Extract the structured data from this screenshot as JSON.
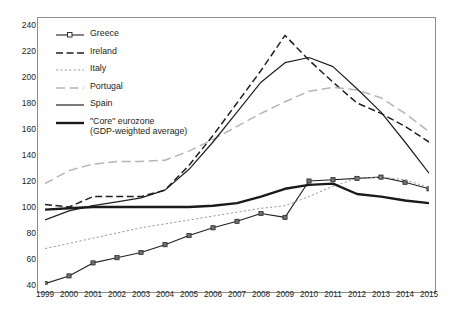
{
  "chart_data": {
    "type": "line",
    "title": "",
    "subtitle": "",
    "xlabel": "",
    "ylabel": "",
    "x": [
      1999,
      2000,
      2001,
      2002,
      2003,
      2004,
      2005,
      2006,
      2007,
      2008,
      2009,
      2010,
      2011,
      2012,
      2013,
      2014,
      2015
    ],
    "xticklabels": [
      "1999",
      "2000",
      "2001",
      "2002",
      "2003",
      "2004",
      "2005",
      "2006",
      "2007",
      "2008",
      "2009",
      "2010",
      "2011",
      "2012",
      "2013",
      "2014",
      "2015"
    ],
    "yticklabels": [
      "40",
      "60",
      "80",
      "100",
      "120",
      "140",
      "160",
      "180",
      "200",
      "220",
      "240"
    ],
    "yticks": [
      40,
      60,
      80,
      100,
      120,
      140,
      160,
      180,
      200,
      220,
      240
    ],
    "ylim": [
      40,
      240
    ],
    "grid": false,
    "legend_position": "upper-left",
    "series": [
      {
        "name": "Greece",
        "style": "solid-marker",
        "color": "#231f20",
        "marker": "square",
        "values": [
          41,
          47,
          57,
          61,
          65,
          71,
          78,
          84,
          89,
          95,
          92,
          120,
          121,
          122,
          123,
          119,
          114
        ]
      },
      {
        "name": "Ireland",
        "style": "dashed",
        "color": "#231f20",
        "marker": "none",
        "values": [
          102,
          100,
          108,
          108,
          108,
          113,
          132,
          155,
          180,
          205,
          232,
          213,
          196,
          180,
          172,
          162,
          150
        ]
      },
      {
        "name": "Italy",
        "style": "dotted",
        "color": "#9c9c9c",
        "marker": "none",
        "values": [
          68,
          72,
          76,
          80,
          84,
          87,
          90,
          93,
          96,
          99,
          101,
          108,
          116,
          122,
          123,
          121,
          115
        ]
      },
      {
        "name": "Portugal",
        "style": "long-dashed",
        "color": "#b5b5b5",
        "marker": "none",
        "values": [
          118,
          128,
          133,
          135,
          135,
          136,
          143,
          152,
          162,
          172,
          181,
          189,
          192,
          190,
          184,
          172,
          158
        ]
      },
      {
        "name": "Spain",
        "style": "solid-thin",
        "color": "#231f20",
        "marker": "none",
        "values": [
          90,
          97,
          101,
          104,
          107,
          113,
          129,
          150,
          173,
          196,
          211,
          215,
          208,
          191,
          173,
          150,
          126
        ]
      },
      {
        "name": "\"Core\" eurozone",
        "sublabel": "(GDP-weighted average)",
        "style": "solid-thick",
        "color": "#1a1a1a",
        "marker": "none",
        "values": [
          98,
          99,
          100,
          100,
          100,
          100,
          100,
          101,
          103,
          108,
          114,
          117,
          118,
          110,
          108,
          105,
          103
        ]
      }
    ]
  },
  "axes": {
    "y_min_label": "40",
    "y_max_label": "240"
  }
}
